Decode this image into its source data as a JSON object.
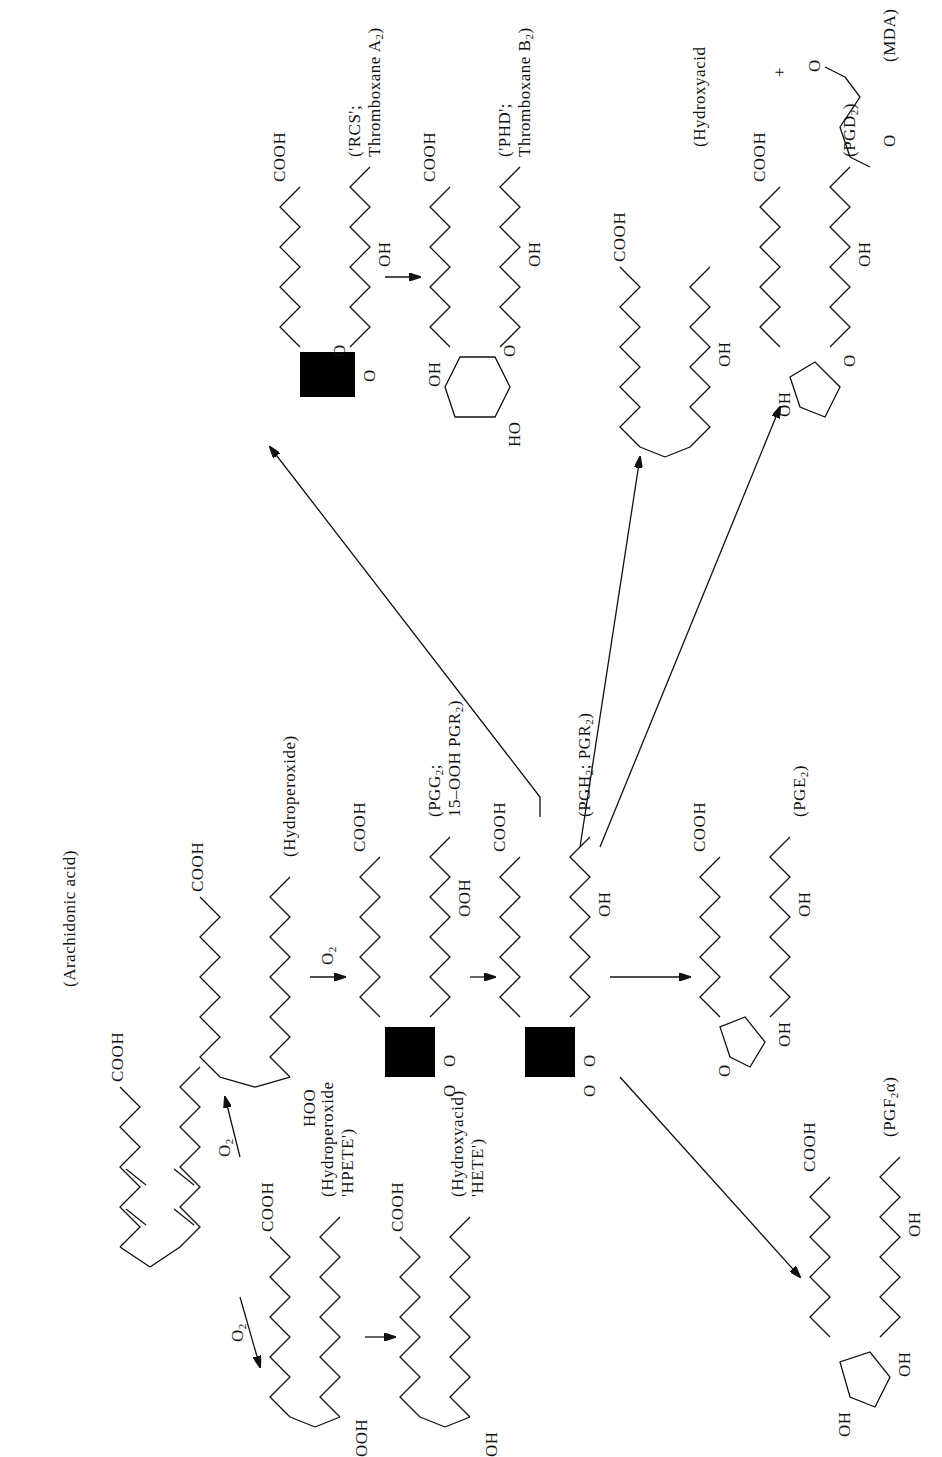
{
  "diagram": {
    "compounds": [
      {
        "id": "arachidonic_acid",
        "label": "(Arachidonic acid)",
        "groups": [
          "COOH"
        ]
      },
      {
        "id": "hpete",
        "label_line1": "(Hydroperoxide",
        "label_line2": "'HPETE')",
        "groups": [
          "COOH",
          "OOH"
        ]
      },
      {
        "id": "hete",
        "label_line1": "(Hydroxyacid)",
        "label_line2": "'HETE')",
        "groups": [
          "COOH",
          "OH"
        ]
      },
      {
        "id": "hydroperoxide",
        "label": "(Hydroperoxide)",
        "groups": [
          "COOH",
          "HOO"
        ]
      },
      {
        "id": "pgg2",
        "label_line1": "(PGG2;",
        "label_line2": "15–OOH PGR2)",
        "groups": [
          "COOH",
          "OOH",
          "O",
          "O"
        ]
      },
      {
        "id": "pgh2",
        "label": "(PGH2; PGR2)",
        "groups": [
          "COOH",
          "OH",
          "O",
          "O"
        ]
      },
      {
        "id": "txa2",
        "label_line1": "('RCS';",
        "label_line2": "Thromboxane A2)",
        "groups": [
          "COOH",
          "OH",
          "O",
          "O"
        ]
      },
      {
        "id": "txb2",
        "label_line1": "('PHD';",
        "label_line2": "Thromboxane B2)",
        "groups": [
          "COOH",
          "OH",
          "OH",
          "HO",
          "O"
        ]
      },
      {
        "id": "hydroxyacid_hht",
        "label": "(Hydroxyacid",
        "groups": [
          "COOH",
          "OH"
        ]
      },
      {
        "id": "mda",
        "label": "(MDA)",
        "groups": [
          "O",
          "O"
        ],
        "plus": "+"
      },
      {
        "id": "pgd2",
        "label": "(PGD2)",
        "groups": [
          "COOH",
          "OH",
          "OH",
          "O"
        ]
      },
      {
        "id": "pge2",
        "label": "(PGE2)",
        "groups": [
          "COOH",
          "OH",
          "OH",
          "O"
        ]
      },
      {
        "id": "pgf2a",
        "label": "(PGF2α)",
        "groups": [
          "COOH",
          "OH",
          "OH",
          "OH"
        ]
      }
    ],
    "reagents": {
      "o2_a": "O2",
      "o2_b": "O2",
      "o2_c": "O2"
    },
    "edges": [
      {
        "from": "arachidonic_acid",
        "to": "hpete",
        "reagent": "O2"
      },
      {
        "from": "arachidonic_acid",
        "to": "hydroperoxide",
        "reagent": "O2"
      },
      {
        "from": "hpete",
        "to": "hete"
      },
      {
        "from": "hydroperoxide",
        "to": "pgg2",
        "reagent": "O2"
      },
      {
        "from": "pgg2",
        "to": "pgh2"
      },
      {
        "from": "pgh2",
        "to": "txa2"
      },
      {
        "from": "txa2",
        "to": "txb2"
      },
      {
        "from": "pgh2",
        "to": "hydroxyacid_hht"
      },
      {
        "from": "pgh2",
        "to": "pgd2"
      },
      {
        "from": "pgh2",
        "to": "pge2"
      },
      {
        "from": "pgh2",
        "to": "pgf2a"
      }
    ]
  },
  "text": {
    "cooh": "COOH",
    "oh": "OH",
    "ooh": "OOH",
    "hoo": "HOO",
    "ho": "HO",
    "o": "O",
    "o2": "O",
    "two": "2",
    "plus": "+",
    "arachidonic": "(Arachidonic acid)",
    "hpete1": "(Hydroperoxide",
    "hpete2": "'HPETE')",
    "hete1": "(Hydroxyacid)",
    "hete2": "'HETE')",
    "hydroperoxide": "(Hydroperoxide)",
    "pgg1": "(PGG",
    "pgg1b": ";",
    "pgg2": "15–OOH PGR",
    "pgg2b": ")",
    "pgh": "(PGH",
    "pghb": "; PGR",
    "pghc": ")",
    "rcs1": "('RCS';",
    "rcs2": "Thromboxane A",
    "rcs2b": ")",
    "phd1": "('PHD';",
    "phd2": "Thromboxane B",
    "phd2b": ")",
    "hydroxyacid": "(Hydroxyacid",
    "mda": "(MDA)",
    "pgd": "(PGD",
    "pgdb": ")",
    "pge": "(PGE",
    "pgeb": ")",
    "pgf": "(PGF",
    "pgfb": "α)"
  }
}
